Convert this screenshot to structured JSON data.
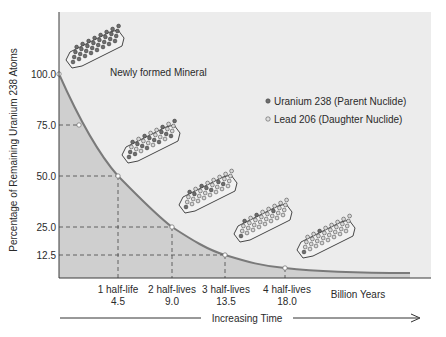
{
  "chart_data": {
    "type": "area",
    "title": "",
    "xlabel": "Increasing Time",
    "ylabel": "Percentage of Remaining Uranium 238 Atoms",
    "x_unit_label": "Billion Years",
    "x": [
      0,
      4.5,
      9.0,
      13.5,
      18.0
    ],
    "x_tick_labels": [
      {
        "top": "1 half-life",
        "bottom": "4.5"
      },
      {
        "top": "2 half-lives",
        "bottom": "9.0"
      },
      {
        "top": "3 half-lives",
        "bottom": "13.5"
      },
      {
        "top": "4 half-lives",
        "bottom": "18.0"
      }
    ],
    "y_ticks": [
      "100.0",
      "75.0",
      "50.0",
      "25.0",
      "12.5"
    ],
    "series": [
      {
        "name": "Remaining Uranium 238 (%)",
        "values": [
          100.0,
          50.0,
          25.0,
          12.5,
          6.25
        ]
      }
    ],
    "extra_points": [
      {
        "x": 2.25,
        "y": 75.0
      }
    ],
    "ylim": [
      0,
      125
    ],
    "grid": false,
    "guide_lines": "dashed",
    "annotations": [
      "Newly formed Mineral"
    ],
    "legend": {
      "position": "upper-right",
      "entries": [
        {
          "label": "Uranium 238 (Parent Nuclide)",
          "marker": "dark-dot"
        },
        {
          "label": "Lead 206 (Daughter Nuclide)",
          "marker": "light-dot"
        }
      ]
    },
    "mineral_crystals": [
      {
        "stage": "0 half-lives",
        "uranium_fraction": 1.0
      },
      {
        "stage": "1 half-life",
        "uranium_fraction": 0.5
      },
      {
        "stage": "2 half-lives",
        "uranium_fraction": 0.25
      },
      {
        "stage": "3 half-lives",
        "uranium_fraction": 0.125
      },
      {
        "stage": "4 half-lives",
        "uranium_fraction": 0.0625
      }
    ],
    "colors": {
      "plot_bg": "#ececec",
      "area_fill": "#cfcfcf",
      "curve": "#7a7a7a",
      "axis": "#3a3a3a",
      "uranium_dot": "#6e6e6e",
      "lead_dot": "#d8d8d8"
    }
  },
  "labels": {
    "ylabel": "Percentage of Remaining Uranium 238 Atoms",
    "newly_formed": "Newly formed Mineral",
    "legend_uranium": "Uranium 238 (Parent Nuclide)",
    "legend_lead": "Lead 206 (Daughter Nuclide)",
    "billion_years": "Billion Years",
    "increasing_time": "Increasing Time",
    "y100": "100.0",
    "y75": "75.0",
    "y50": "50.0",
    "y25": "25.0",
    "y12": "12.5",
    "hl1": "1 half-life",
    "hl1v": "4.5",
    "hl2": "2 half-lives",
    "hl2v": "9.0",
    "hl3": "3 half-lives",
    "hl3v": "13.5",
    "hl4": "4 half-lives",
    "hl4v": "18.0"
  }
}
